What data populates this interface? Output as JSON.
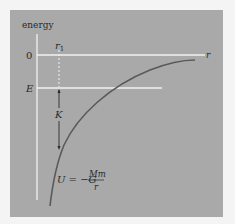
{
  "diagram": {
    "y_axis_label": "energy",
    "x_axis_label": "r",
    "zero_label": "0",
    "energy_level_label": "E",
    "r1_label": "r",
    "r1_subscript": "1",
    "kinetic_label": "K",
    "equation": {
      "lhs": "U = −G",
      "numerator": "Mm",
      "denominator": "r"
    },
    "colors": {
      "panel": "#a9a9a9",
      "axis_lines": "#f2f2f2",
      "curve": "#5a5a5a",
      "text": "#2a2a2a"
    }
  }
}
